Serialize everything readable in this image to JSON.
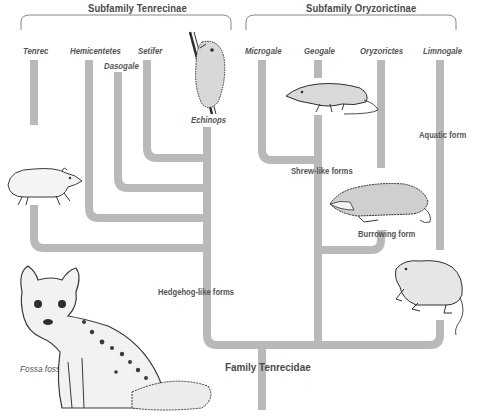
{
  "subfamilies": [
    {
      "name": "Subfamily Tenrecinae"
    },
    {
      "name": "Subfamily Oryzorictinae"
    }
  ],
  "genera": {
    "tenrecinae": [
      "Tenrec",
      "Hemicentetes",
      "Dasogale",
      "Setifer",
      "Echinops"
    ],
    "oryzorictinae": [
      "Microgale",
      "Geogale",
      "Oryzorictes",
      "Limnogale"
    ]
  },
  "forms": {
    "hedgehog": "Hedgehog-like forms",
    "shrew": "Shrew-like forms",
    "burrowing": "Burrowing form",
    "aquatic": "Aquatic form"
  },
  "family": "Family Tenrecidae",
  "outgroup": "Fossa fossa",
  "colors": {
    "branch": "#b9b9b9",
    "text": "#4a4a4a",
    "ink": "#2e2e2e"
  },
  "illustrations": [
    "echinops-climbing-icon",
    "tenrec-icon",
    "fossa-icon",
    "shrew-tenrec-icon",
    "mole-tenrec-icon",
    "water-tenrec-icon"
  ]
}
